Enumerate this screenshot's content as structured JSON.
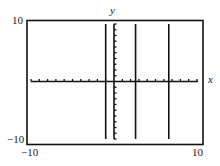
{
  "chart_data": {
    "type": "line",
    "title": "",
    "xlabel": "x",
    "ylabel": "y",
    "xlim": [
      -10,
      10
    ],
    "ylim": [
      -10,
      10
    ],
    "grid": false,
    "x_tick_step": 1,
    "y_tick_step": 1,
    "tick_labels": {
      "x_min": "−10",
      "x_max": "10",
      "y_min": "−10",
      "y_max": "10"
    },
    "series": [
      {
        "name": "vertical line 1",
        "x": [
          -1.0,
          -1.0
        ],
        "y": [
          -10,
          10
        ]
      },
      {
        "name": "vertical line 2",
        "x": [
          2.6,
          2.6
        ],
        "y": [
          -10,
          10
        ]
      },
      {
        "name": "vertical line 3",
        "x": [
          6.6,
          6.6
        ],
        "y": [
          -10,
          10
        ]
      }
    ]
  },
  "colors": {
    "axis": "#111111",
    "curve": "#111111",
    "frame": "#111111"
  }
}
